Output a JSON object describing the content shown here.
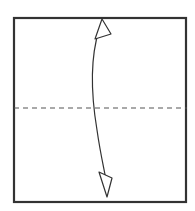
{
  "figure": {
    "kind": "origami-fold-diagram",
    "title": "Origami step: valley fold square in half horizontally",
    "canvas": {
      "width": 195,
      "height": 211,
      "background_color": "#ffffff"
    },
    "paper": {
      "label": "paper-square",
      "left": 14,
      "top": 18,
      "right": 186,
      "bottom": 202,
      "width": 172,
      "height": 184,
      "fill_color": "#ffffff",
      "stroke_color": "#333333",
      "stroke_width": 2.2
    },
    "fold_line": {
      "label": "horizontal-fold-line",
      "style": "dashed",
      "meaning": "valley fold",
      "y": 108,
      "x_start": 14,
      "x_end": 187,
      "stroke_color": "#555555",
      "stroke_width": 1.1,
      "dash_pattern": "5 4"
    },
    "arrow": {
      "label": "fold-and-unfold-arrow",
      "style": "double-headed curved",
      "meaning": "fold in half then unfold",
      "stroke_color": "#333333",
      "stroke_width": 1.2,
      "head_fill": "#ffffff",
      "head_stroke": "#333333",
      "path": "M 99 30 C 89 62, 92 100, 97 130 C 101 158, 105 172, 107 186",
      "top_head": {
        "label": "arrowhead-up",
        "direction": "up",
        "filled": false,
        "tip_x": 102,
        "tip_y": 19
      },
      "bottom_head": {
        "label": "arrowhead-down",
        "direction": "down",
        "filled": false,
        "tip_x": 107,
        "tip_y": 197
      }
    }
  }
}
